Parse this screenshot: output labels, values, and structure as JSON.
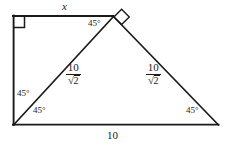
{
  "figure": {
    "type": "geometry-diagram",
    "stroke_color": "#1a1a1a",
    "background_color": "#ffffff",
    "vertices": {
      "top_left": [
        13,
        16
      ],
      "apex": [
        113,
        16
      ],
      "bottom_left": [
        13,
        125
      ],
      "bottom_right": [
        218,
        125
      ]
    },
    "labels": {
      "top_side": "x",
      "bottom_side": "10",
      "left_hyp_fraction": {
        "numerator": "10",
        "denominator_radicand": "2"
      },
      "right_hyp_fraction": {
        "numerator": "10",
        "denominator_radicand": "2"
      },
      "angle_apex": "45°",
      "angle_left_upper": "45°",
      "angle_left_lower": "45°",
      "angle_bottom_right": "45°",
      "radical_glyph": "√"
    },
    "markers": {
      "top_left_right_angle": "square-right-angle-marker",
      "apex_right_angle": "diamond-right-angle-marker"
    }
  }
}
